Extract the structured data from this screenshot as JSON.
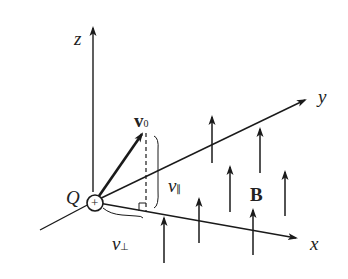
{
  "diagram": {
    "axes": {
      "z": "z",
      "y": "y",
      "x": "x"
    },
    "charge": {
      "label": "Q",
      "symbol": "+"
    },
    "velocity": {
      "label": "v",
      "subscript": "0"
    },
    "v_parallel": {
      "label": "v",
      "subscript": "∥"
    },
    "v_perp": {
      "label": "v",
      "subscript": "⊥"
    },
    "field": {
      "label": "B"
    },
    "colors": {
      "ink": "#1a1a1a",
      "background": "#ffffff"
    }
  }
}
